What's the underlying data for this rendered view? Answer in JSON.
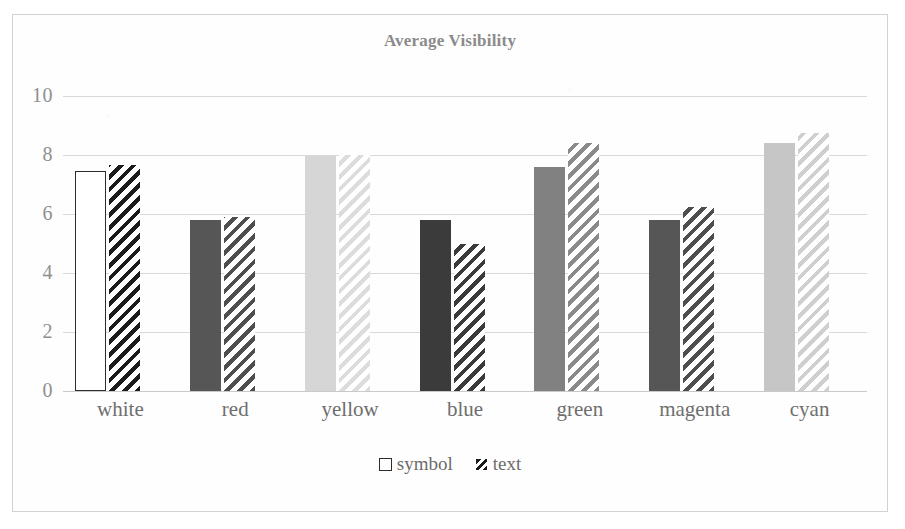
{
  "chart_data": {
    "type": "bar",
    "title": "Average Visibility",
    "xlabel": "",
    "ylabel": "",
    "ylim": [
      0,
      10
    ],
    "yticks": [
      0,
      2,
      4,
      6,
      8,
      10
    ],
    "grid": true,
    "legend_position": "bottom",
    "categories": [
      "white",
      "red",
      "yellow",
      "blue",
      "green",
      "magenta",
      "cyan"
    ],
    "series": [
      {
        "name": "symbol",
        "values": [
          7.45,
          5.8,
          8.0,
          5.8,
          7.6,
          5.8,
          8.4
        ],
        "style": "solid"
      },
      {
        "name": "text",
        "values": [
          7.65,
          5.9,
          8.0,
          5.0,
          8.4,
          6.25,
          8.75
        ],
        "style": "diagonal-hatch"
      }
    ]
  },
  "title": "Average Visibility",
  "axis": {
    "y_tick_labels": [
      "10",
      "8",
      "6",
      "4",
      "2",
      "0"
    ]
  },
  "legend": {
    "items": [
      {
        "label": "symbol",
        "swatch": "white-square-outline-icon"
      },
      {
        "label": "text",
        "swatch": "hatched-square-icon"
      }
    ]
  },
  "colors": {
    "white_symbol": "#ffffff",
    "white_text": "#1b1b1b",
    "red_symbol": "#565656",
    "red_text": "#4e4e4e",
    "yellow_symbol": "#d6d6d6",
    "yellow_text": "#dcdcdc",
    "blue_symbol": "#3b3b3b",
    "blue_text": "#3a3a3a",
    "green_symbol": "#818181",
    "green_text": "#8a8a8a",
    "magenta_symbol": "#565656",
    "magenta_text": "#4e4e4e",
    "cyan_symbol": "#c6c6c6",
    "cyan_text": "#cfcfcf",
    "title": "#8b8b8b",
    "gridline": "#d9d9d9",
    "border": "#d2d2d2"
  }
}
